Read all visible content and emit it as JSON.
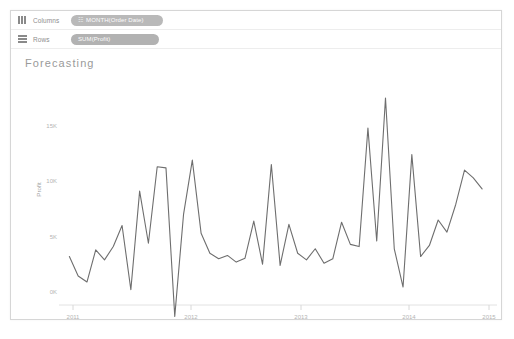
{
  "window": {
    "background": "#ffffff",
    "border_color": "#d6d6d6"
  },
  "shelves": {
    "columns": {
      "label": "Columns",
      "icon": "columns-icon",
      "pill": {
        "text": "MONTH(Order Date)",
        "glyph": "☷",
        "color": "#b9b9b9"
      }
    },
    "rows": {
      "label": "Rows",
      "icon": "rows-icon",
      "pill": {
        "text": "SUM(Profit)",
        "glyph": "",
        "color": "#b2b2b2"
      }
    }
  },
  "viz": {
    "title": "Forecasting"
  },
  "chart_data": {
    "type": "line",
    "title": "Forecasting",
    "xlabel": "Month of Order Date",
    "ylabel": "Profit",
    "line_color": "#6e6e6e",
    "grid": false,
    "legend": "none",
    "ylim": [
      -2500,
      18500
    ],
    "yticks": [
      0,
      5000,
      10000,
      15000
    ],
    "ytick_labels": [
      "0K",
      "5K",
      "10K",
      "15K"
    ],
    "xticks": [
      "2011",
      "2012",
      "2013",
      "2014",
      "2015"
    ],
    "x": [
      "2011-01",
      "2011-02",
      "2011-03",
      "2011-04",
      "2011-05",
      "2011-06",
      "2011-07",
      "2011-08",
      "2011-09",
      "2011-10",
      "2011-11",
      "2011-12",
      "2012-01",
      "2012-02",
      "2012-03",
      "2012-04",
      "2012-05",
      "2012-06",
      "2012-07",
      "2012-08",
      "2012-09",
      "2012-10",
      "2012-11",
      "2012-12",
      "2013-01",
      "2013-02",
      "2013-03",
      "2013-04",
      "2013-05",
      "2013-06",
      "2013-07",
      "2013-08",
      "2013-09",
      "2013-10",
      "2013-11",
      "2013-12",
      "2014-01",
      "2014-02",
      "2014-03",
      "2014-04",
      "2014-05",
      "2014-06",
      "2014-07",
      "2014-08",
      "2014-09",
      "2014-10",
      "2014-11",
      "2014-12"
    ],
    "values": [
      3200,
      1450,
      900,
      3800,
      2900,
      4100,
      6000,
      200,
      9100,
      4400,
      11300,
      11200,
      -2200,
      7000,
      11900,
      5300,
      3500,
      3000,
      3300,
      2700,
      3050,
      6400,
      2500,
      11500,
      2400,
      6100,
      3500,
      2900,
      3900,
      2600,
      3000,
      6300,
      4300,
      4100,
      14800,
      4600,
      17500,
      3900,
      450,
      12400,
      3200,
      4200,
      6500,
      5400,
      7900,
      11000,
      10300,
      9300
    ],
    "series": [
      {
        "name": "Profit",
        "values": [
          3200,
          1450,
          900,
          3800,
          2900,
          4100,
          6000,
          200,
          9100,
          4400,
          11300,
          11200,
          -2200,
          7000,
          11900,
          5300,
          3500,
          3000,
          3300,
          2700,
          3050,
          6400,
          2500,
          11500,
          2400,
          6100,
          3500,
          2900,
          3900,
          2600,
          3000,
          6300,
          4300,
          4100,
          14800,
          4600,
          17500,
          3900,
          450,
          12400,
          3200,
          4200,
          6500,
          5400,
          7900,
          11000,
          10300,
          9300
        ]
      }
    ]
  }
}
